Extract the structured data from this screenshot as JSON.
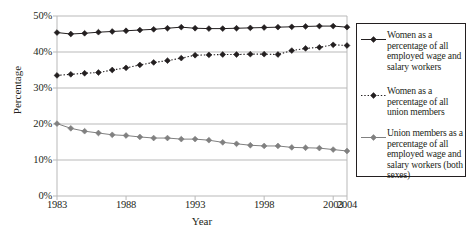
{
  "chart_data": {
    "type": "line",
    "title": "",
    "subtitle": "",
    "xlabel": "Year",
    "ylabel": "Percentage",
    "xlim": [
      1983,
      2004
    ],
    "ylim": [
      0,
      50
    ],
    "ytick_labels": [
      "0%",
      "10%",
      "20%",
      "30%",
      "40%",
      "50%"
    ],
    "ytick_values": [
      0,
      10,
      20,
      30,
      40,
      50
    ],
    "xtick_labels": [
      "1983",
      "1988",
      "1993",
      "1998",
      "2003",
      "2004"
    ],
    "xtick_values": [
      1983,
      1988,
      1993,
      1998,
      2003,
      2004
    ],
    "grid": "horizontal",
    "legend_position": "right-outside",
    "x": [
      1983,
      1984,
      1985,
      1986,
      1987,
      1988,
      1989,
      1990,
      1991,
      1992,
      1993,
      1994,
      1995,
      1996,
      1997,
      1998,
      1999,
      2000,
      2001,
      2002,
      2003,
      2004
    ],
    "series": [
      {
        "name": "Women as a percentage of all employed wage and salary workers",
        "style": "solid",
        "color": "#231f20",
        "marker": "diamond",
        "values": [
          45.4,
          45.0,
          45.2,
          45.5,
          45.7,
          45.9,
          46.1,
          46.3,
          46.6,
          46.9,
          46.6,
          46.5,
          46.5,
          46.6,
          46.7,
          46.8,
          46.9,
          47.0,
          47.1,
          47.2,
          47.2,
          46.9
        ]
      },
      {
        "name": "Women as a percentage of all union members",
        "style": "dotted",
        "color": "#231f20",
        "marker": "diamond",
        "values": [
          33.5,
          33.8,
          34.1,
          34.3,
          35.0,
          35.6,
          36.4,
          37.1,
          37.6,
          38.3,
          39.1,
          39.2,
          39.3,
          39.3,
          39.4,
          39.4,
          39.3,
          40.4,
          41.0,
          41.3,
          42.0,
          41.8
        ]
      },
      {
        "name": "Union members as a percentage of all employed wage and salary workers (both sexes)",
        "style": "solid",
        "color": "#808080",
        "marker": "diamond",
        "values": [
          20.1,
          18.8,
          18.0,
          17.5,
          17.0,
          16.8,
          16.4,
          16.1,
          16.1,
          15.8,
          15.8,
          15.5,
          14.9,
          14.5,
          14.1,
          13.9,
          13.9,
          13.5,
          13.4,
          13.3,
          12.9,
          12.5
        ]
      }
    ]
  },
  "legend": {
    "entries": [
      {
        "label": "Women as a percentage of all employed wage and salary workers",
        "marker": "solid-line-diamond-marker"
      },
      {
        "label": "Women as a percentage of all union members",
        "marker": "dotted-line-diamond-marker"
      },
      {
        "label": "Union members as a percentage of all employed wage and salary workers (both sexes)",
        "marker": "gray-solid-line-diamond-marker"
      }
    ]
  },
  "colors": {
    "axis": "#231f20",
    "grid": "#b9b9b9",
    "series_1": "#231f20",
    "series_2": "#231f20",
    "series_3": "#808080",
    "background": "#ffffff"
  }
}
